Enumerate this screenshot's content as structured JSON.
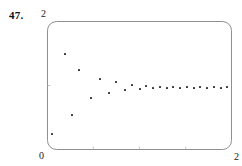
{
  "figure": {
    "problem_number": "47."
  },
  "chart_data": {
    "type": "scatter",
    "title": "",
    "xlabel": "",
    "ylabel": "",
    "xlim": [
      0,
      2
    ],
    "ylim": [
      0,
      2
    ],
    "grid": false,
    "legend": null,
    "x_tick_labels": [
      "0",
      "2"
    ],
    "y_tick_labels": [
      "2"
    ],
    "marker_color": "#2b2b2b",
    "frame_color": "#8f8f8f",
    "points": [
      {
        "x": 0.054,
        "y": 0.248
      },
      {
        "x": 0.195,
        "y": 1.488
      },
      {
        "x": 0.27,
        "y": 0.543
      },
      {
        "x": 0.346,
        "y": 1.24
      },
      {
        "x": 0.475,
        "y": 0.806
      },
      {
        "x": 0.573,
        "y": 1.1
      },
      {
        "x": 0.67,
        "y": 0.884
      },
      {
        "x": 0.746,
        "y": 1.055
      },
      {
        "x": 0.843,
        "y": 0.93
      },
      {
        "x": 0.919,
        "y": 1.008
      },
      {
        "x": 1.005,
        "y": 0.946
      },
      {
        "x": 1.07,
        "y": 0.992
      },
      {
        "x": 1.146,
        "y": 0.961
      },
      {
        "x": 1.222,
        "y": 0.977
      },
      {
        "x": 1.298,
        "y": 0.961
      },
      {
        "x": 1.362,
        "y": 0.977
      },
      {
        "x": 1.438,
        "y": 0.961
      },
      {
        "x": 1.514,
        "y": 0.977
      },
      {
        "x": 1.589,
        "y": 0.961
      },
      {
        "x": 1.654,
        "y": 0.977
      },
      {
        "x": 1.73,
        "y": 0.961
      },
      {
        "x": 1.805,
        "y": 0.977
      },
      {
        "x": 1.881,
        "y": 0.961
      },
      {
        "x": 1.946,
        "y": 0.977
      }
    ],
    "x_ticks": [
      0.5,
      1.0,
      1.5
    ],
    "y_ticks": [
      1.0
    ]
  }
}
